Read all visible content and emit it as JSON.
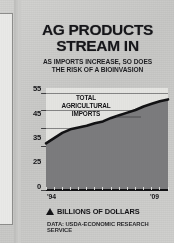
{
  "headline": {
    "line1": "AG PRODUCTS",
    "line2": "STREAM IN"
  },
  "subhead": {
    "line1": "AS IMPORTS INCREASE, SO DOES",
    "line2": "THE RISK OF A BIOINVASION"
  },
  "footer": {
    "unit_label": "BILLIONS OF DOLLARS",
    "unit_marker_icon": "triangle-up-icon",
    "source": "DATA: USDA-ECONOMIC RESEARCH SERVICE"
  },
  "colors": {
    "area_fill": "#7b7b7d",
    "line": "#121214",
    "plot_background": "#e4e4e1",
    "page_background": "#c9c9c7",
    "text": "#141417"
  },
  "chart_data": {
    "type": "area",
    "title": "AG PRODUCTS STREAM IN",
    "subtitle": "AS IMPORTS INCREASE, SO DOES THE RISK OF A BIOINVASION",
    "series_label_lines": [
      "TOTAL",
      "AGRICULTURAL",
      "IMPORTS"
    ],
    "series": [
      {
        "name": "TOTAL AGRICULTURAL IMPORTS",
        "values": [
          26.5,
          29.5,
          32.5,
          34.5,
          35.5,
          36.5,
          38.0,
          39.0,
          41.0,
          42.5,
          44.0,
          45.5,
          47.5,
          49.0,
          50.5,
          51.5
        ]
      }
    ],
    "x": [
      "'94",
      "'95",
      "'96",
      "'97",
      "'98",
      "'99",
      "'00",
      "'01",
      "'02",
      "'03",
      "'04",
      "'05",
      "'06",
      "'07",
      "'08",
      "'09"
    ],
    "xtick_labels": [
      "'94",
      "'09"
    ],
    "ytick_labels": [
      "55",
      "45",
      "35",
      "25",
      "0"
    ],
    "ytick_values": [
      55,
      45,
      35,
      25,
      0
    ],
    "ylim": [
      0,
      58
    ],
    "xlabel": "",
    "ylabel": "BILLIONS OF DOLLARS",
    "grid": true,
    "legend": "inline-annotation",
    "source": "DATA: USDA-ECONOMIC RESEARCH SERVICE"
  }
}
